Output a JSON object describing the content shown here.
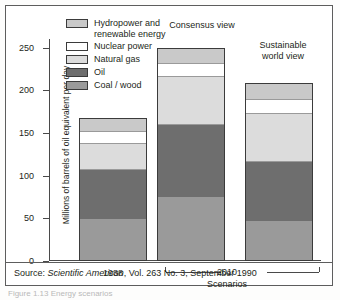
{
  "figure": {
    "source_prefix": "Source: ",
    "source_italic": "Scientific American",
    "source_rest": ", Vol. 263 No. 3, September 1990",
    "caption_cut": "Figure 1.13  Energy scenarios"
  },
  "axis": {
    "ylabel": "Millions of barrels of oil equivalent per day",
    "yticks": [
      "0",
      "50",
      "100",
      "150",
      "200",
      "250"
    ],
    "xlabel": "Scenarios",
    "group_1988": "1988",
    "group_2010": "2010"
  },
  "bar_titles": {
    "consensus": "Consensus view",
    "sustainable_line1": "Sustainable",
    "sustainable_line2": "world view"
  },
  "legend": {
    "items": [
      {
        "label": "Hydropower and\nrenewable energy",
        "color": "#c9c9c9"
      },
      {
        "label": "Nuclear power",
        "color": "#ffffff"
      },
      {
        "label": "Natural gas",
        "color": "#dcdcdc"
      },
      {
        "label": "Oil",
        "color": "#6e6e6e"
      },
      {
        "label": "Coal / wood",
        "color": "#9a9a9a"
      }
    ]
  },
  "colors": {
    "hydropower": "#c9c9c9",
    "nuclear": "#ffffff",
    "natural_gas": "#dcdcdc",
    "oil": "#6e6e6e",
    "coal_wood": "#9a9a9a",
    "axis": "#4a4a4a",
    "frame": "#5d5d5d",
    "text": "#231f20"
  },
  "chart_data": {
    "type": "bar",
    "subtype": "stacked",
    "title": "",
    "xlabel": "Scenarios",
    "ylabel": "Millions of barrels of oil equivalent per day",
    "ylim": [
      0,
      260
    ],
    "yticks": [
      0,
      50,
      100,
      150,
      200,
      250
    ],
    "grid": false,
    "legend_position": "upper-left-inside",
    "categories": [
      "1988",
      "Consensus view",
      "Sustainable world view"
    ],
    "category_groups": [
      "1988",
      "2010",
      "2010"
    ],
    "series": [
      {
        "name": "Coal / wood",
        "color": "#9a9a9a",
        "values": [
          47,
          73,
          45
        ]
      },
      {
        "name": "Oil",
        "color": "#6e6e6e",
        "values": [
          60,
          87,
          71
        ]
      },
      {
        "name": "Natural gas",
        "color": "#dcdcdc",
        "values": [
          31,
          56,
          57
        ]
      },
      {
        "name": "Nuclear power",
        "color": "#ffffff",
        "values": [
          14,
          16,
          16
        ]
      },
      {
        "name": "Hydropower and renewable energy",
        "color": "#c9c9c9",
        "values": [
          15,
          18,
          20
        ]
      }
    ],
    "totals": [
      167,
      250,
      209
    ],
    "cumulative_tops": {
      "1988": {
        "coal_wood": 47,
        "oil": 107,
        "natural_gas": 138,
        "nuclear": 152,
        "hydropower": 167
      },
      "consensus_view": {
        "coal_wood": 73,
        "oil": 160,
        "natural_gas": 216,
        "nuclear": 232,
        "hydropower": 250
      },
      "sustainable_world_view": {
        "coal_wood": 45,
        "oil": 116,
        "natural_gas": 173,
        "nuclear": 189,
        "hydropower": 209
      }
    },
    "annotations": [
      "Source: Scientific American, Vol. 263 No. 3, September 1990"
    ]
  }
}
